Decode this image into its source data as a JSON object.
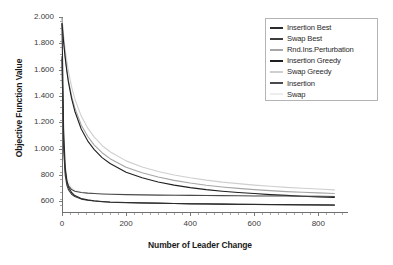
{
  "chart_data": {
    "type": "line",
    "title": "",
    "xlabel": "Number of Leader Change",
    "ylabel": "Objective Function Value",
    "xlim": [
      0,
      880
    ],
    "ylim": [
      520,
      2000
    ],
    "grid": false,
    "legend_position": "top-right",
    "x_tick_labels": [
      "0",
      "200",
      "400",
      "600",
      "800"
    ],
    "x_tick_values": [
      0,
      200,
      400,
      600,
      800
    ],
    "y_tick_labels": [
      "600",
      "800",
      "1.000",
      "1.200",
      "1.400",
      "1.600",
      "1.800",
      "2.000"
    ],
    "y_tick_values": [
      600,
      800,
      1000,
      1200,
      1400,
      1600,
      1800,
      2000
    ],
    "x": [
      0,
      5,
      10,
      15,
      20,
      30,
      40,
      60,
      80,
      100,
      125,
      150,
      200,
      250,
      300,
      350,
      400,
      450,
      500,
      550,
      600,
      650,
      700,
      750,
      800,
      850
    ],
    "series": [
      {
        "name": "Insertion Best",
        "color": "#2b2b2b",
        "values": [
          1950,
          1150,
          860,
          760,
          710,
          668,
          645,
          622,
          612,
          605,
          600,
          596,
          592,
          589,
          587,
          585,
          583,
          582,
          580,
          579,
          578,
          577,
          576,
          575,
          574,
          573
        ]
      },
      {
        "name": "Swap Best",
        "color": "#3d3d3d",
        "values": [
          1700,
          1010,
          800,
          725,
          690,
          655,
          637,
          618,
          609,
          603,
          598,
          594,
          590,
          588,
          586,
          584,
          582,
          581,
          580,
          578,
          577,
          576,
          575,
          574,
          573,
          572
        ]
      },
      {
        "name": "Rnd.Ins.Perturbation",
        "color": "#a6a6a6",
        "values": [
          1990,
          1820,
          1700,
          1600,
          1520,
          1400,
          1310,
          1180,
          1095,
          1030,
          970,
          925,
          860,
          818,
          785,
          760,
          740,
          723,
          710,
          699,
          690,
          682,
          675,
          670,
          665,
          660
        ]
      },
      {
        "name": "Insertion Greedy",
        "color": "#1f1f1f",
        "values": [
          1950,
          1810,
          1690,
          1590,
          1505,
          1380,
          1285,
          1150,
          1060,
          995,
          933,
          888,
          822,
          780,
          748,
          724,
          705,
          690,
          678,
          668,
          660,
          652,
          646,
          640,
          635,
          630
        ]
      },
      {
        "name": "Swap Greedy",
        "color": "#cfcfcf",
        "values": [
          1990,
          1860,
          1755,
          1665,
          1590,
          1470,
          1378,
          1248,
          1158,
          1090,
          1025,
          977,
          908,
          862,
          828,
          801,
          780,
          762,
          747,
          735,
          724,
          715,
          707,
          700,
          694,
          688
        ]
      },
      {
        "name": "Insertion",
        "color": "#4a4a4a",
        "values": [
          1680,
          1030,
          830,
          755,
          720,
          690,
          678,
          668,
          663,
          660,
          657,
          655,
          652,
          650,
          648,
          647,
          646,
          645,
          644,
          643,
          642,
          641,
          641,
          640,
          639,
          638
        ]
      },
      {
        "name": "Swap",
        "color": "#ededed",
        "values": [
          1950,
          1120,
          880,
          790,
          748,
          706,
          686,
          672,
          666,
          662,
          659,
          657,
          654,
          652,
          651,
          650,
          649,
          648,
          647,
          646,
          645,
          645,
          644,
          643,
          643,
          642
        ]
      }
    ]
  },
  "legend": {
    "entries": [
      {
        "label": "Insertion Best"
      },
      {
        "label": "Swap Best"
      },
      {
        "label": "Rnd.Ins.Perturbation"
      },
      {
        "label": "Insertion Greedy"
      },
      {
        "label": "Swap Greedy"
      },
      {
        "label": "Insertion"
      },
      {
        "label": "Swap"
      }
    ]
  }
}
